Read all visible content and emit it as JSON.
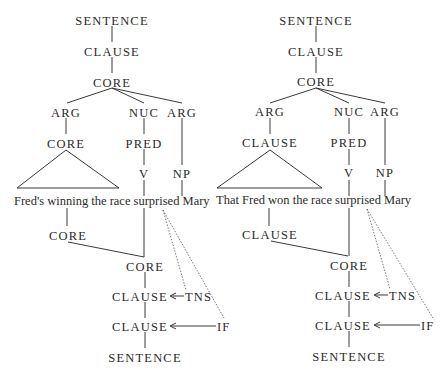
{
  "diagram": {
    "type": "RRG syntactic tree pair",
    "left_tree": {
      "top": {
        "sentence": "SENTENCE",
        "clause": "CLAUSE",
        "core": "CORE",
        "arg1": "ARG",
        "nuc": "NUC",
        "arg2": "ARG",
        "arg1_child": "CORE",
        "pred": "PRED",
        "v": "V",
        "np": "NP"
      },
      "sentence_text": {
        "subject": "Fred's winning the race",
        "verb": "surprised",
        "object": "Mary"
      },
      "bottom": {
        "arg_core": "CORE",
        "core": "CORE",
        "clause_tns": "CLAUSE",
        "tns": "TNS",
        "clause_if": "CLAUSE",
        "if": "IF",
        "sentence": "SENTENCE"
      }
    },
    "right_tree": {
      "top": {
        "sentence": "SENTENCE",
        "clause": "CLAUSE",
        "core": "CORE",
        "arg1": "ARG",
        "nuc": "NUC",
        "arg2": "ARG",
        "arg1_child": "CLAUSE",
        "pred": "PRED",
        "v": "V",
        "np": "NP"
      },
      "sentence_text": {
        "subject": "That Fred won the race",
        "verb": "surprised",
        "object": "Mary"
      },
      "bottom": {
        "arg_core": "CLAUSE",
        "core": "CORE",
        "clause_tns": "CLAUSE",
        "tns": "TNS",
        "clause_if": "CLAUSE",
        "if": "IF",
        "sentence": "SENTENCE"
      }
    },
    "arrow_glyph": "←"
  }
}
